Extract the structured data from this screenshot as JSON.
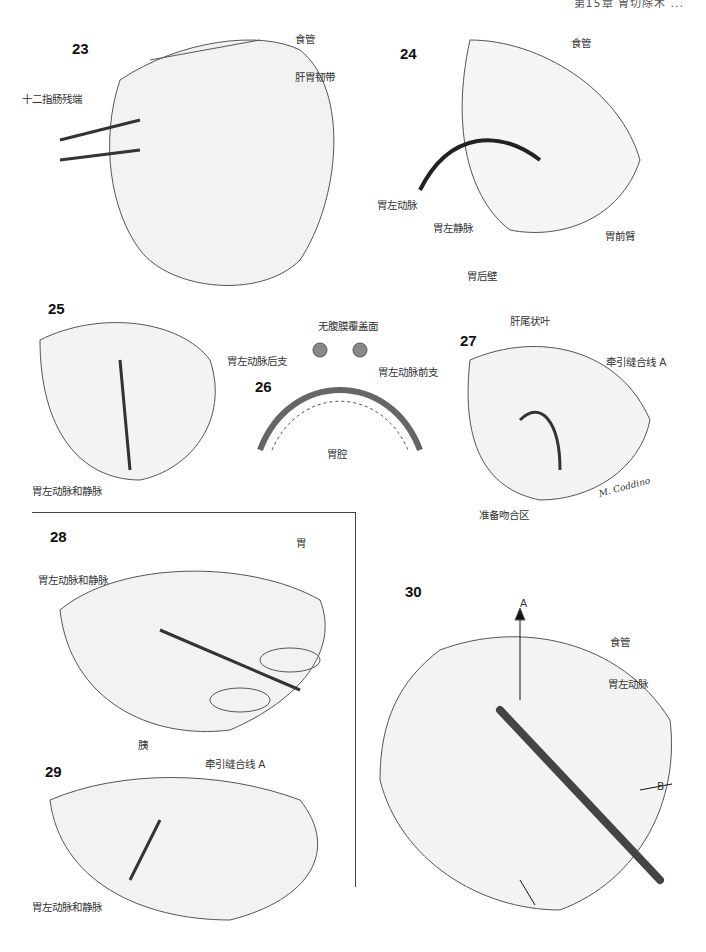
{
  "page_header": {
    "text": "第15章 胃切除术 ..."
  },
  "figures": [
    {
      "number": "23",
      "labels": [
        "食管",
        "肝胃韧带",
        "十二指肠残端"
      ]
    },
    {
      "number": "24",
      "labels": [
        "食管",
        "胃左动脉",
        "胃左静脉",
        "胃后壁",
        "胃前臂"
      ]
    },
    {
      "number": "25",
      "labels": [
        "胃左动脉和静脉"
      ]
    },
    {
      "number": "26",
      "labels": [
        "无腹膜覆盖面",
        "胃左动脉后支",
        "胃左动脉前支",
        "胃腔"
      ]
    },
    {
      "number": "27",
      "labels": [
        "肝尾状叶",
        "牵引缝合线 A",
        "准备吻合区"
      ],
      "signature": "M. Coddino"
    },
    {
      "number": "28",
      "labels": [
        "胃",
        "胃左动脉和静脉",
        "胰"
      ]
    },
    {
      "number": "29",
      "labels": [
        "牵引缝合线 A",
        "胃左动脉和静脉"
      ]
    },
    {
      "number": "30",
      "labels": [
        "A",
        "食管",
        "胃左动脉",
        "B"
      ]
    }
  ]
}
